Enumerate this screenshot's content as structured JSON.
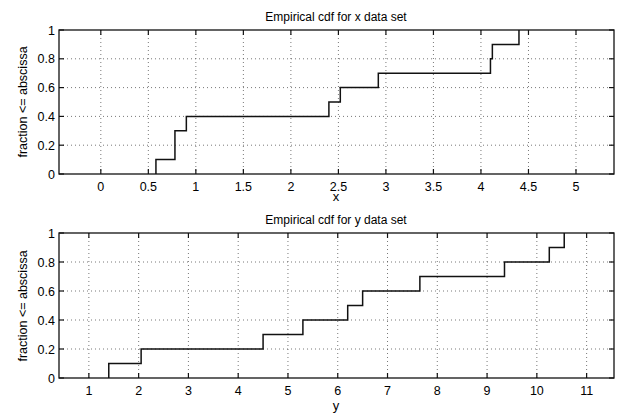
{
  "chart_data": [
    {
      "type": "line",
      "step": true,
      "title": "Empirical cdf for x data set",
      "xlabel": "x",
      "ylabel": "fraction <= abscissa",
      "xlim": [
        -0.44,
        5.4
      ],
      "ylim": [
        0,
        1
      ],
      "grid": true,
      "xticks": [
        0,
        0.5,
        1,
        1.5,
        2,
        2.5,
        3,
        3.5,
        4,
        4.5,
        5
      ],
      "xtick_labels": [
        "0",
        "0.5",
        "1",
        "1.5",
        "2",
        "2.5",
        "3",
        "3.5",
        "4",
        "4.5",
        "5"
      ],
      "yticks": [
        0,
        0.2,
        0.4,
        0.6,
        0.8,
        1
      ],
      "ytick_labels": [
        "0",
        "0.2",
        "0.4",
        "0.6",
        "0.8",
        "1"
      ],
      "x": [
        0.58,
        0.78,
        0.78,
        0.9,
        2.4,
        2.52,
        2.92,
        4.1,
        4.12,
        4.4
      ],
      "steps": [
        {
          "x": 0.58,
          "y": 0.1
        },
        {
          "x": 0.78,
          "y": 0.3
        },
        {
          "x": 0.9,
          "y": 0.4
        },
        {
          "x": 2.4,
          "y": 0.5
        },
        {
          "x": 2.52,
          "y": 0.6
        },
        {
          "x": 2.92,
          "y": 0.7
        },
        {
          "x": 4.1,
          "y": 0.8
        },
        {
          "x": 4.12,
          "y": 0.9
        },
        {
          "x": 4.4,
          "y": 1.0
        }
      ]
    },
    {
      "type": "line",
      "step": true,
      "title": "Empirical cdf for y data set",
      "xlabel": "y",
      "ylabel": "fraction <= abscissa",
      "xlim": [
        0.4,
        11.55
      ],
      "ylim": [
        0,
        1
      ],
      "grid": true,
      "xticks": [
        1,
        2,
        3,
        4,
        5,
        6,
        7,
        8,
        9,
        10,
        11
      ],
      "xtick_labels": [
        "1",
        "2",
        "3",
        "4",
        "5",
        "6",
        "7",
        "8",
        "9",
        "10",
        "11"
      ],
      "yticks": [
        0,
        0.2,
        0.4,
        0.6,
        0.8,
        1
      ],
      "ytick_labels": [
        "0",
        "0.2",
        "0.4",
        "0.6",
        "0.8",
        "1"
      ],
      "x": [
        1.4,
        2.05,
        4.5,
        5.3,
        6.2,
        6.5,
        7.65,
        9.35,
        10.25,
        10.55
      ],
      "steps": [
        {
          "x": 1.4,
          "y": 0.1
        },
        {
          "x": 2.05,
          "y": 0.2
        },
        {
          "x": 4.5,
          "y": 0.3
        },
        {
          "x": 5.3,
          "y": 0.4
        },
        {
          "x": 6.2,
          "y": 0.5
        },
        {
          "x": 6.5,
          "y": 0.6
        },
        {
          "x": 7.65,
          "y": 0.7
        },
        {
          "x": 9.35,
          "y": 0.8
        },
        {
          "x": 10.25,
          "y": 0.9
        },
        {
          "x": 10.55,
          "y": 1.0
        }
      ]
    }
  ],
  "layout": {
    "panels": [
      {
        "left": 59,
        "right": 614,
        "top": 30,
        "bottom": 174
      },
      {
        "left": 59,
        "right": 614,
        "top": 233,
        "bottom": 378
      }
    ]
  },
  "colors": {
    "line": "#111111",
    "grid": "#555555",
    "background": "#ffffff"
  }
}
